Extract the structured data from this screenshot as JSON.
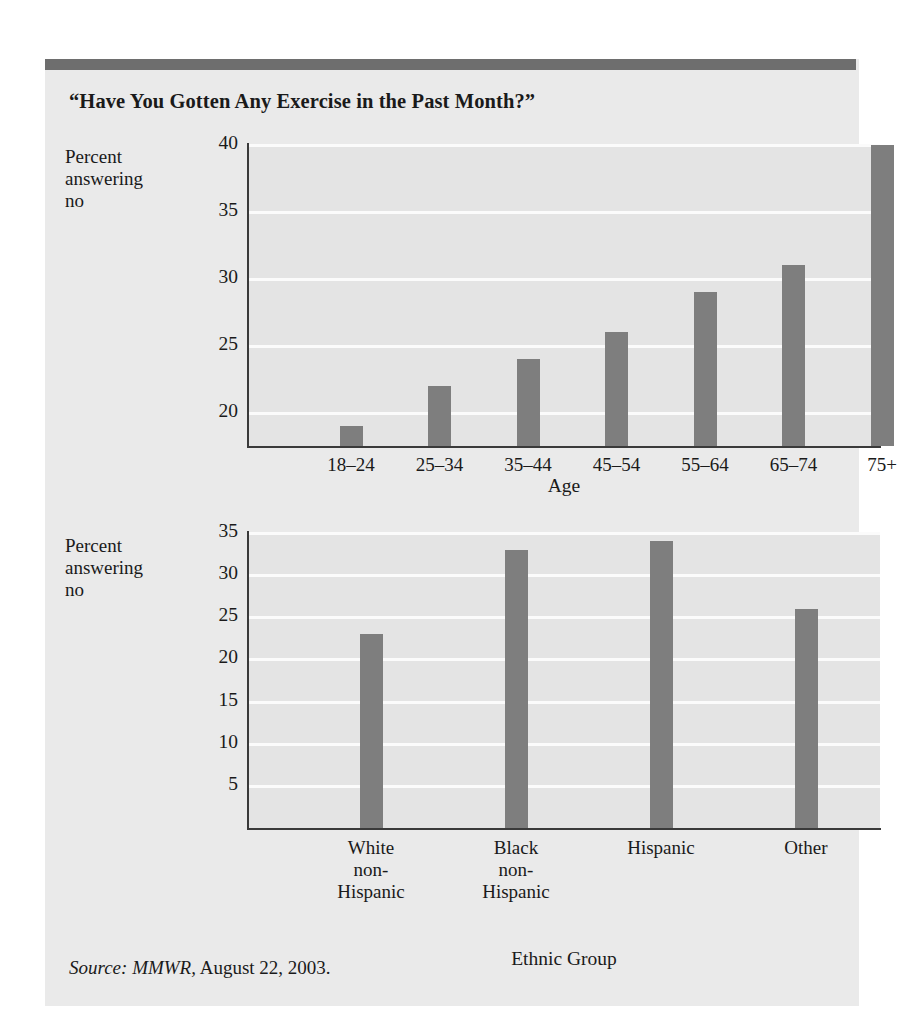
{
  "figure": {
    "title": "“Have You Gotten Any Exercise in the Past Month?”",
    "source_label": "Source: MMWR,",
    "source_rest": " August 22, 2003.",
    "accent_rule_color": "#6e6e6e",
    "panel_color": "#eaeaea",
    "bar_color": "#7e7e7e",
    "gridline_color": "#fbfbfb",
    "axis_color": "#3a3a3a"
  },
  "chart_data": [
    {
      "type": "bar",
      "id": "age",
      "title": "",
      "ylabel": "Percent\nanswering\nno",
      "ylabel_lines": [
        "Percent",
        "answering",
        "no"
      ],
      "xlabel": "Age",
      "categories": [
        "18–24",
        "25–34",
        "35–44",
        "45–54",
        "55–64",
        "65–74",
        "75+"
      ],
      "values": [
        19,
        22,
        24,
        26,
        29,
        31,
        40
      ],
      "yticks": [
        20,
        25,
        30,
        35,
        40
      ],
      "ytick_labels": [
        "20",
        "25",
        "30",
        "35",
        "40"
      ],
      "ylim": [
        17.5,
        40
      ],
      "grid": true,
      "legend": "none"
    },
    {
      "type": "bar",
      "id": "ethnic",
      "title": "",
      "ylabel": "Percent\nanswering\nno",
      "ylabel_lines": [
        "Percent",
        "answering",
        "no"
      ],
      "xlabel": "Ethnic Group",
      "categories": [
        "White\nnon-\nHispanic",
        "Black\nnon-\nHispanic",
        "Hispanic",
        "Other"
      ],
      "values": [
        23,
        33,
        34,
        26
      ],
      "yticks": [
        5,
        10,
        15,
        20,
        25,
        30,
        35
      ],
      "ytick_labels": [
        "5",
        "10",
        "15",
        "20",
        "25",
        "30",
        "35"
      ],
      "ylim": [
        0,
        35
      ],
      "grid": true,
      "legend": "none"
    }
  ]
}
